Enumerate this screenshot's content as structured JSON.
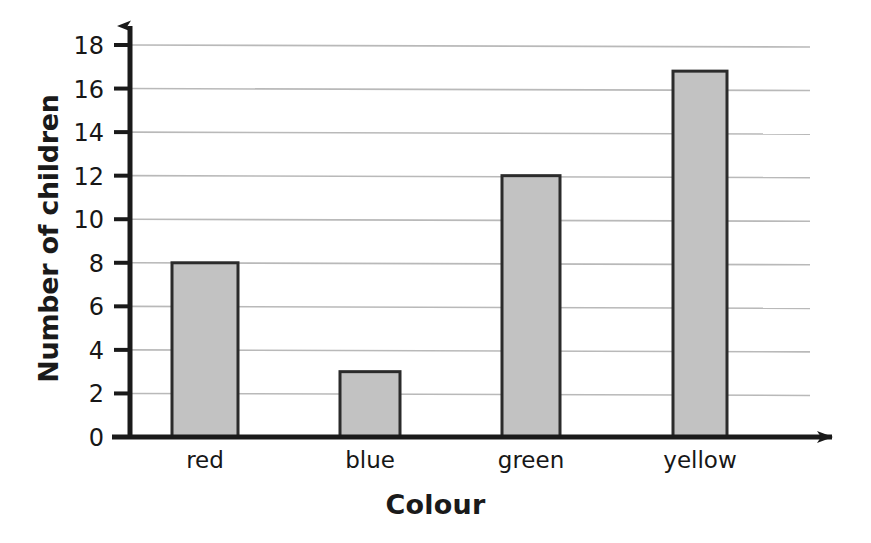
{
  "chart_data": {
    "type": "bar",
    "title": "",
    "xlabel": "Colour",
    "ylabel": "Number of children",
    "categories": [
      "red",
      "blue",
      "green",
      "yellow"
    ],
    "values": [
      8,
      3,
      12,
      16.8
    ],
    "series": [
      {
        "name": "Number of children",
        "values": [
          8,
          3,
          12,
          16.8
        ]
      }
    ],
    "ylim": [
      0,
      18
    ],
    "xlim_note": "categorical",
    "ytick_labels": [
      "0",
      "2",
      "4",
      "6",
      "8",
      "10",
      "12",
      "14",
      "16",
      "18"
    ],
    "ytick_values": [
      0,
      2,
      4,
      6,
      8,
      10,
      12,
      14,
      16,
      18
    ],
    "grid": true,
    "grid_axis": "y",
    "legend": false,
    "legend_position": "none",
    "bar_fill_color": "#c2c2c2",
    "bar_border_color": "#2b2b2b",
    "axis_color": "#1a1a1a",
    "gridline_color": "#b9b9b9",
    "background_color": "#ffffff",
    "axis_arrows": true,
    "annotations": []
  },
  "axis": {
    "y_title": "Number of children",
    "x_title": "Colour"
  }
}
